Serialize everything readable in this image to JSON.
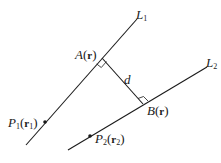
{
  "diagram": {
    "lines": [
      {
        "id": "L1",
        "label_main": "L",
        "label_sub": "1",
        "from": [
          26,
          145
        ],
        "to": [
          137,
          19
        ]
      },
      {
        "id": "L2",
        "label_main": "L",
        "label_sub": "2",
        "from": [
          68,
          150
        ],
        "to": [
          207,
          67
        ]
      }
    ],
    "perpendicular": {
      "from": [
        102,
        58
      ],
      "to": [
        143,
        104
      ],
      "label": "d"
    },
    "points": {
      "A": {
        "name": "A",
        "vec": "r",
        "pos": [
          102,
          58
        ]
      },
      "B": {
        "name": "B",
        "vec": "r",
        "pos": [
          143,
          104
        ]
      },
      "P1": {
        "name": "P",
        "sub": "1",
        "vec": "r",
        "vec_sub": "1",
        "pos": [
          45,
          122
        ]
      },
      "P2": {
        "name": "P",
        "sub": "2",
        "vec": "r",
        "vec_sub": "2",
        "pos": [
          90,
          136
        ]
      }
    },
    "colors": {
      "stroke": "#1a1a1a",
      "background": "#ffffff"
    }
  }
}
